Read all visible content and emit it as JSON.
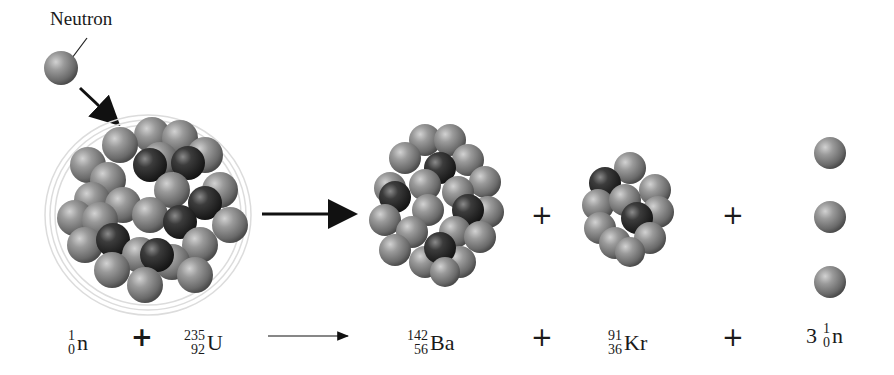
{
  "diagram": {
    "labels": {
      "neutron": "Neutron"
    },
    "colors": {
      "proton_dark": "#2e2e2e",
      "neutron_gray": "#8a8a8a",
      "arrow": "#111111",
      "halo": "#d8d8d8"
    },
    "illustration": {
      "incoming": "neutron",
      "target": "U-235 nucleus (with excitation halo)",
      "products": [
        "Ba-142 nucleus",
        "Kr-91 nucleus",
        "3 free neutrons"
      ],
      "plus_signs": [
        "+",
        "+"
      ]
    },
    "equation": {
      "reactant1": {
        "mass": "1",
        "atomic": "0",
        "symbol": "n"
      },
      "op1": "+",
      "reactant2": {
        "mass": "235",
        "atomic": "92",
        "symbol": "U"
      },
      "product1": {
        "mass": "142",
        "atomic": "56",
        "symbol": "Ba"
      },
      "op2": "+",
      "product2": {
        "mass": "91",
        "atomic": "36",
        "symbol": "Kr"
      },
      "op3": "+",
      "product3": {
        "coefficient": "3",
        "mass": "1",
        "atomic": "0",
        "symbol": "n"
      }
    }
  }
}
